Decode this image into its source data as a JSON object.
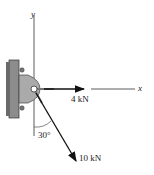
{
  "axes": {
    "x_label": "x",
    "y_label": "y"
  },
  "forces": [
    {
      "label": "4 kN",
      "direction": "along +x"
    },
    {
      "label": "10 kN",
      "direction": "30° from -y axis"
    }
  ],
  "angle": {
    "label": "30°"
  },
  "colors": {
    "line": "#222222",
    "plate": "#9a9a9a",
    "bracket": "#b4b4b4"
  }
}
